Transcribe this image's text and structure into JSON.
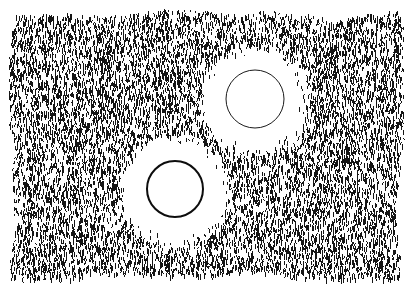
{
  "canvas": {
    "width": 412,
    "height": 288,
    "background_color": "#ffffff",
    "ink_color": "#111111",
    "title": "Stippled hatch field with two circular voids"
  },
  "texture_field": {
    "name": "hatch-field",
    "description": "Dense field of short vertical pen strokes",
    "stroke_color": "#151515",
    "stroke_width": 1,
    "stroke_min_length": 2,
    "stroke_max_length": 6,
    "stroke_count": 17000,
    "bounds": {
      "left": 12,
      "top": 12,
      "right": 401,
      "bottom": 276
    },
    "edge_waviness": 5,
    "density": 0.82,
    "seed": 20240517
  },
  "voids": [
    {
      "id": "void-upper-right",
      "label": "Upper right circular void",
      "center_x": 255,
      "center_y": 99,
      "clear_radius": 44,
      "fade_radius": 57,
      "inner_circle_radius": 29,
      "inner_circle_stroke_width": 1,
      "inner_circle_color": "#1a1a1a",
      "fill": "#ffffff"
    },
    {
      "id": "void-lower-left",
      "label": "Lower left circular void",
      "center_x": 175,
      "center_y": 189,
      "clear_radius": 45,
      "fade_radius": 58,
      "inner_circle_radius": 28,
      "inner_circle_stroke_width": 2,
      "inner_circle_color": "#0d0d0d",
      "fill": "#ffffff"
    }
  ],
  "chart_data": {
    "type": "scatter",
    "xlabel": "",
    "ylabel": "",
    "xlim": [
      0,
      412
    ],
    "ylim": [
      0,
      288
    ],
    "grid": false,
    "legend": null,
    "marker": "vertical-tick",
    "point_count": 17000,
    "annotations": [
      {
        "shape": "circle",
        "cx": 255,
        "cy": 99,
        "r": 29,
        "filled": false
      },
      {
        "shape": "circle",
        "cx": 175,
        "cy": 189,
        "r": 28,
        "filled": false
      }
    ],
    "series": [
      {
        "name": "hatch-strokes",
        "color": "#151515",
        "region": {
          "x0": 12,
          "y0": 12,
          "x1": 401,
          "y1": 276
        },
        "excluded_regions": [
          {
            "cx": 255,
            "cy": 99,
            "r": 44
          },
          {
            "cx": 175,
            "cy": 189,
            "r": 45
          }
        ]
      }
    ]
  }
}
